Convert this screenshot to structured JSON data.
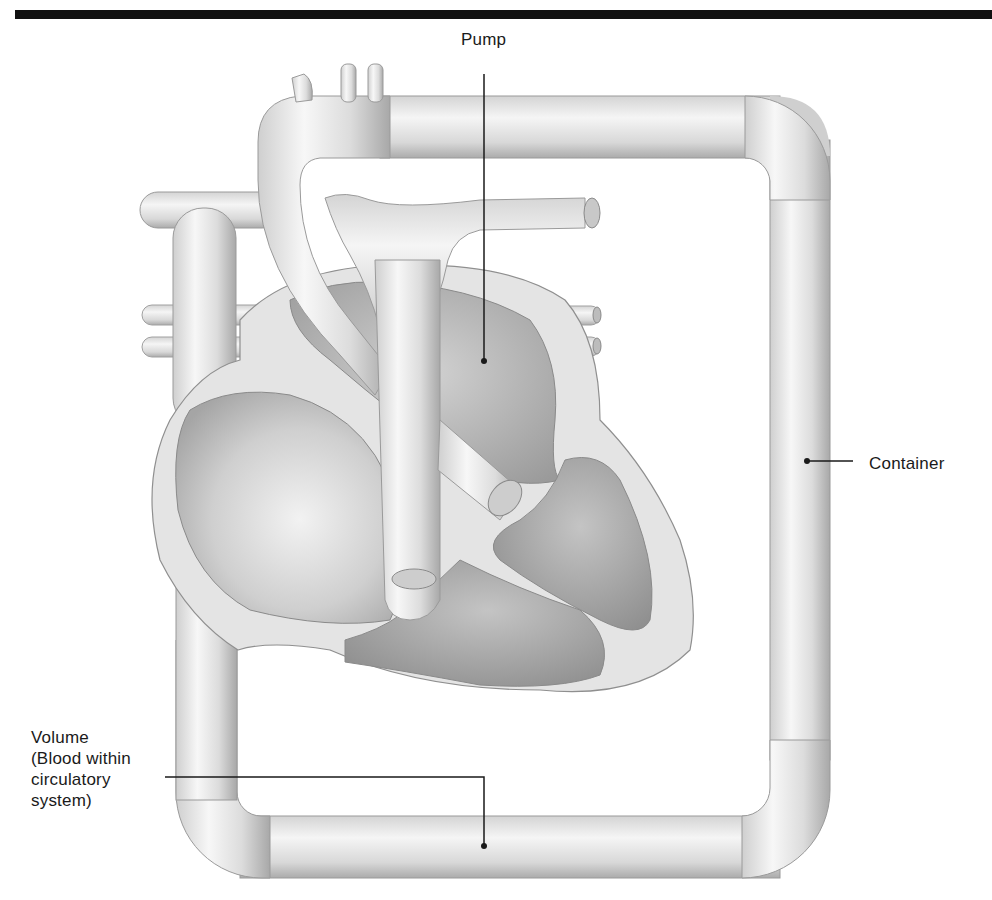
{
  "figure": {
    "colors": {
      "rule": "#111111",
      "vessel_light": "#f4f4f4",
      "vessel_mid": "#d6d6d6",
      "vessel_dark": "#a9a9a9",
      "chamber_dark": "#9c9c9c",
      "leader_line": "#1a1a1a"
    }
  },
  "labels": {
    "pump": "Pump",
    "container": "Container",
    "volume": {
      "line1": "Volume",
      "line2": "(Blood within",
      "line3": "circulatory",
      "line4": "system)"
    }
  }
}
